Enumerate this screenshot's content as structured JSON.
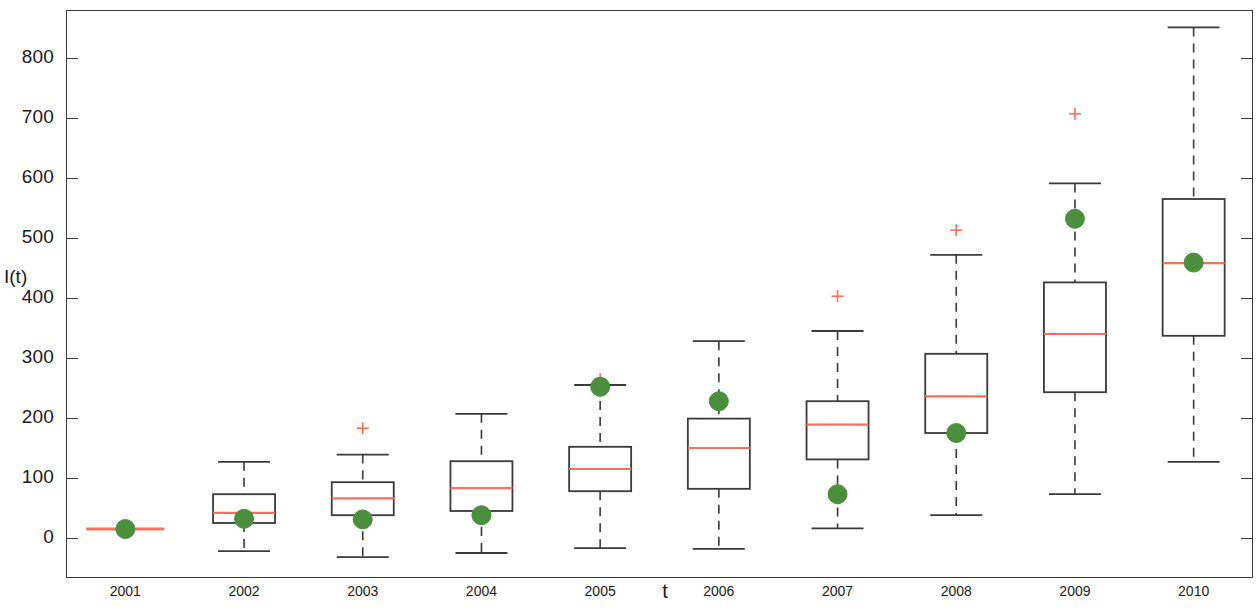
{
  "chart_data": {
    "type": "box",
    "title": "",
    "xlabel": "t",
    "ylabel": "I(t)",
    "grid": false,
    "legend": false,
    "xlim": [
      2000.5,
      2010.5
    ],
    "ylim": [
      -60,
      880
    ],
    "y_ticks": [
      0,
      100,
      200,
      300,
      400,
      500,
      600,
      700,
      800
    ],
    "y_tick_labels": [
      "0",
      "100",
      "200",
      "300",
      "400",
      "500",
      "600",
      "700",
      "800"
    ],
    "categories": [
      "2001",
      "2002",
      "2003",
      "2004",
      "2005",
      "2006",
      "2007",
      "2008",
      "2009",
      "2010"
    ],
    "colors": {
      "box_line": "#3a3a3a",
      "median_line": "#f4705f",
      "outlier_marker": "#f4705f",
      "point_marker": "#4a8f3c",
      "whisker": "#3a3a3a",
      "background": "#ffffff"
    },
    "boxes": [
      {
        "category": "2001",
        "whisker_low": 15,
        "q1": 15,
        "median": 15,
        "q3": 15,
        "whisker_high": 15,
        "outliers": [],
        "point": 15
      },
      {
        "category": "2002",
        "whisker_low": -22,
        "q1": 25,
        "median": 42,
        "q3": 73,
        "whisker_high": 127,
        "outliers": [],
        "point": 32
      },
      {
        "category": "2003",
        "whisker_low": -32,
        "q1": 38,
        "median": 66,
        "q3": 93,
        "whisker_high": 139,
        "outliers": [
          183
        ],
        "point": 31
      },
      {
        "category": "2004",
        "whisker_low": -25,
        "q1": 45,
        "median": 83,
        "q3": 128,
        "whisker_high": 207,
        "outliers": [],
        "point": 38
      },
      {
        "category": "2005",
        "whisker_low": -17,
        "q1": 78,
        "median": 115,
        "q3": 152,
        "whisker_high": 255,
        "outliers": [
          265
        ],
        "point": 252
      },
      {
        "category": "2006",
        "whisker_low": -18,
        "q1": 82,
        "median": 150,
        "q3": 199,
        "whisker_high": 328,
        "outliers": [],
        "point": 228
      },
      {
        "category": "2007",
        "whisker_low": 16,
        "q1": 131,
        "median": 189,
        "q3": 228,
        "whisker_high": 345,
        "outliers": [
          403
        ],
        "point": 73
      },
      {
        "category": "2008",
        "whisker_low": 38,
        "q1": 175,
        "median": 236,
        "q3": 307,
        "whisker_high": 472,
        "outliers": [
          513
        ],
        "point": 175
      },
      {
        "category": "2009",
        "whisker_low": 73,
        "q1": 243,
        "median": 340,
        "q3": 426,
        "whisker_high": 591,
        "outliers": [
          707
        ],
        "point": 532
      },
      {
        "category": "2010",
        "whisker_low": 127,
        "q1": 337,
        "median": 458,
        "q3": 565,
        "whisker_high": 851,
        "outliers": [],
        "point": 459
      }
    ]
  }
}
